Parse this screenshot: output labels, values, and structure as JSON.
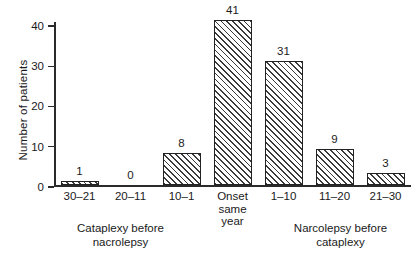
{
  "chart_data": {
    "type": "bar",
    "title": "",
    "subtitle": "",
    "xlabel": "",
    "ylabel": "Number of patients",
    "ylim": [
      0,
      41
    ],
    "yticks": [
      0,
      10,
      20,
      30,
      40
    ],
    "ytick_labels": [
      "0",
      "10",
      "20",
      "30",
      "40"
    ],
    "grid": false,
    "legend": null,
    "categories": [
      "30–21",
      "20–11",
      "10–1",
      "Onset\nsame year",
      "1–10",
      "11–20",
      "21–30"
    ],
    "values": [
      1,
      0,
      8,
      41,
      31,
      9,
      3
    ],
    "value_labels": [
      "1",
      "0",
      "8",
      "41",
      "31",
      "9",
      "3"
    ],
    "bar_style": {
      "fill": "#ffffff",
      "hatch": "forward-diagonal",
      "hatch_color": "#3a3a3a",
      "edge_color": "#222222"
    },
    "annotations": [
      {
        "text": "Cataplexy before\nnacrolepsy",
        "covers": [
          "30–21",
          "20–11",
          "10–1"
        ]
      },
      {
        "text": "Narcolepsy before\ncataplexy",
        "covers": [
          "1–10",
          "11–20",
          "21–30"
        ]
      }
    ]
  },
  "axis": {
    "y_title": "Number of patients",
    "ticks": [
      {
        "label": "0",
        "value": 0
      },
      {
        "label": "10",
        "value": 10
      },
      {
        "label": "20",
        "value": 20
      },
      {
        "label": "30",
        "value": 30
      },
      {
        "label": "40",
        "value": 40
      }
    ]
  },
  "bars": [
    {
      "label": "30–21",
      "value": 1,
      "value_label": "1"
    },
    {
      "label": "20–11",
      "value": 0,
      "value_label": "0"
    },
    {
      "label": "10–1",
      "value": 8,
      "value_label": "8"
    },
    {
      "label": "Onset\nsame year",
      "value": 41,
      "value_label": "41"
    },
    {
      "label": "1–10",
      "value": 31,
      "value_label": "31"
    },
    {
      "label": "11–20",
      "value": 9,
      "value_label": "9"
    },
    {
      "label": "21–30",
      "value": 3,
      "value_label": "3"
    }
  ],
  "groups": {
    "left": {
      "caption": "Cataplexy before\nnacrolepsy"
    },
    "right": {
      "caption": "Narcolepsy before\ncataplexy"
    }
  },
  "colors": {
    "background": "#ffffff",
    "ink": "#1a1a1a",
    "axis": "#2b2b2b",
    "bar_edge": "#222222",
    "bar_hatch": "#3a3a3a"
  }
}
